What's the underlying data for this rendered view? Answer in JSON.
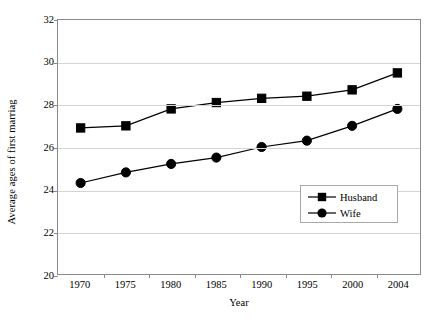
{
  "chart_data": {
    "type": "line",
    "title": "",
    "xlabel": "Year",
    "ylabel": "Average ages of first marriag",
    "categories": [
      "1970",
      "1975",
      "1980",
      "1985",
      "1990",
      "1995",
      "2000",
      "2004"
    ],
    "ylim": [
      20,
      32
    ],
    "yticks": [
      20,
      22,
      24,
      26,
      28,
      30,
      32
    ],
    "grid": true,
    "legend_position": "inside-bottom-right",
    "series": [
      {
        "name": "Husband",
        "marker": "square",
        "color": "#000000",
        "values": [
          26.9,
          27.0,
          27.8,
          28.1,
          28.3,
          28.4,
          28.7,
          29.5
        ]
      },
      {
        "name": "Wife",
        "marker": "circle",
        "color": "#000000",
        "values": [
          24.3,
          24.8,
          25.2,
          25.5,
          26.0,
          26.3,
          27.0,
          27.8
        ]
      }
    ]
  },
  "axis": {
    "y_title": "Average ages of first marriag",
    "x_title": "Year",
    "y_tick_labels": [
      "32",
      "30",
      "28",
      "26",
      "24",
      "22",
      "20"
    ],
    "x_tick_labels": [
      "1970",
      "1975",
      "1980",
      "1985",
      "1990",
      "1995",
      "2000",
      "2004"
    ]
  },
  "legend": {
    "entries": [
      {
        "label": "Husband",
        "marker": "square"
      },
      {
        "label": "Wife",
        "marker": "circle"
      }
    ]
  },
  "colors": {
    "line": "#000000",
    "marker": "#000000",
    "grid": "#d4d4d4",
    "axis": "#8a8a8a",
    "background": "#ffffff"
  }
}
